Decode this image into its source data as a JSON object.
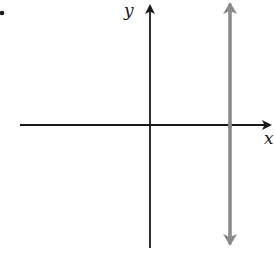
{
  "figure": {
    "bullet": "•",
    "axes": {
      "x_label": "x",
      "y_label": "y",
      "axis_color": "#1a1a1a"
    },
    "vertical_line": {
      "description": "vertical line x = a (a > 0)",
      "color": "#8a8a8a"
    }
  }
}
